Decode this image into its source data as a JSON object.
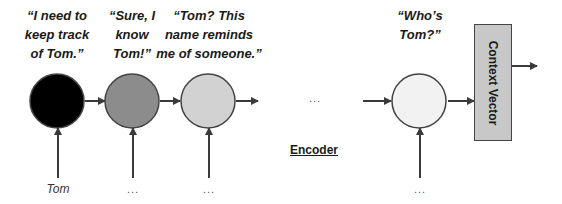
{
  "diagram": {
    "title": "Encoder",
    "nodes": [
      {
        "id": "h1",
        "fill": "#000000",
        "quote": [
          "“I need to",
          "keep track",
          "of Tom.”"
        ],
        "input": "Tom"
      },
      {
        "id": "h2",
        "fill": "#8c8c8c",
        "quote": [
          "“Sure, I",
          "know",
          "Tom!”"
        ],
        "input": "..."
      },
      {
        "id": "h3",
        "fill": "#d2d2d2",
        "quote": [
          "“Tom? This",
          "name reminds",
          "me of someone.”"
        ],
        "input": "..."
      },
      {
        "id": "hn",
        "fill": "#f2f2f2",
        "quote": [
          "“Who’s",
          "Tom?”"
        ],
        "input": "..."
      }
    ],
    "gap_ellipsis": "...",
    "context_vector": {
      "label": "Context Vector",
      "fill": "#c8c8c8"
    },
    "encoder_label": "Encoder",
    "colors": {
      "stroke": "#444444",
      "arrow": "#3a3a3a"
    }
  }
}
